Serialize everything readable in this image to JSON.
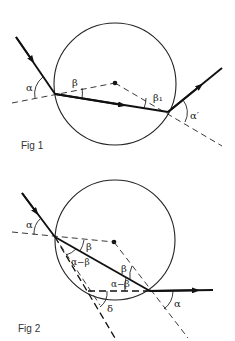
{
  "figures": [
    {
      "caption": "Fig 1",
      "labels": {
        "incidence": "α",
        "refraction": "β",
        "internal": "β₁",
        "emergence": "α′"
      }
    },
    {
      "caption": "Fig 2",
      "labels": {
        "incidence": "α",
        "refraction": "β",
        "deviation_entry": "α−β",
        "internal": "β",
        "deviation_exit": "α−β",
        "total_deviation": "δ",
        "emergence": "α"
      }
    }
  ]
}
